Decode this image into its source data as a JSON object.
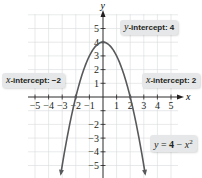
{
  "chart_data": {
    "type": "line",
    "title": "",
    "function": "y = 4 - x^2",
    "xlabel": "x",
    "ylabel": "y",
    "xlim": [
      -5.5,
      5.5
    ],
    "ylim": [
      -5.8,
      5.8
    ],
    "grid": true,
    "x_ticks": [
      -5,
      -4,
      -3,
      -2,
      -1,
      1,
      2,
      3,
      4,
      5
    ],
    "y_ticks": [
      -5,
      -4,
      -3,
      -2,
      -1,
      1,
      2,
      3,
      4,
      5
    ],
    "x_tick_labels": [
      "−5",
      "−4",
      "−3",
      "−2",
      "−1",
      "1",
      "2",
      "3",
      "4",
      "5"
    ],
    "y_tick_labels": [
      "−5",
      "−4",
      "−3",
      "−2",
      "−1",
      "1",
      "2",
      "3",
      "4",
      "5"
    ],
    "series": [
      {
        "name": "y = 4 − x²",
        "x": [
          -3.1,
          -3,
          -2.5,
          -2,
          -1.5,
          -1,
          -0.5,
          0,
          0.5,
          1,
          1.5,
          2,
          2.5,
          3,
          3.1
        ],
        "y": [
          -5.61,
          -5,
          -2.25,
          0,
          1.75,
          3,
          3.75,
          4,
          3.75,
          3,
          1.75,
          0,
          -2.25,
          -5,
          -5.61
        ],
        "color": "#58595b"
      }
    ],
    "annotations": [
      {
        "text": "y-intercept: 4",
        "point": [
          0,
          4
        ]
      },
      {
        "text": "x-intercept: −2",
        "point": [
          -2,
          0
        ]
      },
      {
        "text": "x-intercept: 2",
        "point": [
          2,
          0
        ]
      },
      {
        "text": "y = 4 − x²",
        "label_for": "curve"
      }
    ]
  },
  "labels": {
    "y_intercept_var": "y",
    "y_intercept_text": "-intercept: 4",
    "x_intercept_left_var": "x",
    "x_intercept_left_text": "-intercept: −2",
    "x_intercept_right_var": "x",
    "x_intercept_right_text": "-intercept: 2",
    "equation_lhs": "y",
    "equation_eq": " = ",
    "equation_const": "4",
    "equation_minus": " − ",
    "equation_var": "x",
    "equation_exp": "2",
    "x_axis_label": "x",
    "y_axis_label": "y"
  },
  "colors": {
    "curve": "#58595b",
    "axis": "#231f20",
    "grid": "#d9dadb",
    "callout_bg": "#e6e7e8"
  }
}
